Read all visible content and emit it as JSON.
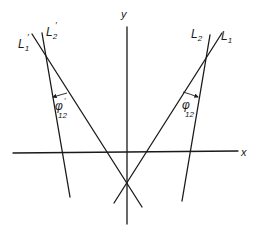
{
  "diagram": {
    "axes": {
      "x_label": "x",
      "y_label": "y"
    },
    "lines": [
      {
        "id": "L1",
        "label": "L",
        "sub": "1",
        "prime": false
      },
      {
        "id": "L2",
        "label": "L",
        "sub": "2",
        "prime": false
      },
      {
        "id": "L1p",
        "label": "L",
        "sub": "1",
        "prime": true
      },
      {
        "id": "L2p",
        "label": "L",
        "sub": "2",
        "prime": true
      }
    ],
    "angles": [
      {
        "id": "phi12",
        "symbol": "φ",
        "sub": "12",
        "prime": false,
        "between": [
          "L1",
          "L2"
        ]
      },
      {
        "id": "phi12p",
        "symbol": "φ",
        "sub": "12",
        "prime": true,
        "between": [
          "L1'",
          "L2'"
        ]
      }
    ],
    "prime_mark": "′",
    "colors": {
      "ink": "#1a1a1a",
      "background": "#ffffff"
    }
  }
}
